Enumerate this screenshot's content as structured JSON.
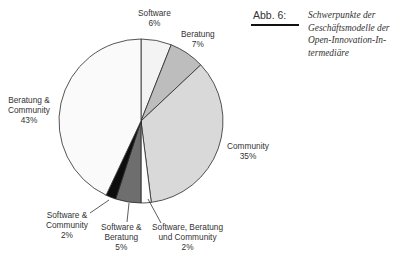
{
  "figure": {
    "number_label": "Abb. 6:",
    "caption_lines": [
      "Schwerpunkte der",
      "Geschäftsmodelle der",
      "Open-Innovation-In-",
      "termediäre"
    ]
  },
  "chart_data": {
    "type": "pie",
    "start_angle_deg": -90,
    "direction": "clockwise",
    "center": [
      141,
      121
    ],
    "radius": 82,
    "legend": "none (direct labels)",
    "slices": [
      {
        "label": "Software",
        "value": 6,
        "pct_label": "6%",
        "color": "#f3f3f3"
      },
      {
        "label": "Beratung",
        "value": 7,
        "pct_label": "7%",
        "color": "#bdbdbd"
      },
      {
        "label": "Community",
        "value": 35,
        "pct_label": "35%",
        "color": "#d9d9d9"
      },
      {
        "label": "Software, Beratung und Community",
        "value": 2,
        "pct_label": "2%",
        "color": "#ffffff"
      },
      {
        "label": "Software & Beratung",
        "value": 5,
        "pct_label": "5%",
        "color": "#6e6e6e"
      },
      {
        "label": "Software & Community",
        "value": 2,
        "pct_label": "2%",
        "color": "#0d0d0d"
      },
      {
        "label": "Beratung & Community",
        "value": 43,
        "pct_label": "43%",
        "color": "#fafafa"
      }
    ]
  },
  "labels": {
    "software": {
      "line1": "Software",
      "line2": "6%"
    },
    "beratung": {
      "line1": "Beratung",
      "line2": "7%"
    },
    "community": {
      "line1": "Community",
      "line2": "35%"
    },
    "sbc": {
      "line1": "Software, Beratung",
      "line2": "und Community",
      "line3": "2%"
    },
    "sb": {
      "line1": "Software &",
      "line2": "Beratung",
      "line3": "5%"
    },
    "sc": {
      "line1": "Software &",
      "line2": "Community",
      "line3": "2%"
    },
    "bc": {
      "line1": "Beratung &",
      "line2": "Community",
      "line3": "43%"
    }
  }
}
